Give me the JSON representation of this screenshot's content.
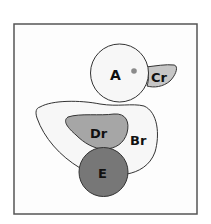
{
  "diagram": {
    "frame": {
      "x": 14,
      "y": 24,
      "width": 183,
      "height": 190,
      "stroke": "#555555"
    },
    "parts": [
      {
        "id": "A",
        "label": "A",
        "name": "head",
        "fill": "#f7f7f7"
      },
      {
        "id": "Cr",
        "label": "Cr",
        "name": "beak",
        "fill": "#c6c6c6"
      },
      {
        "id": "Br",
        "label": "Br",
        "name": "body",
        "fill": "#f7f7f7"
      },
      {
        "id": "Dr",
        "label": "Dr",
        "name": "wing",
        "fill": "#a6a6a6"
      },
      {
        "id": "E",
        "label": "E",
        "name": "base-circle",
        "fill": "#777777"
      }
    ],
    "eye": {
      "fill": "#8a8a8a"
    },
    "outline_color": "#333333"
  }
}
